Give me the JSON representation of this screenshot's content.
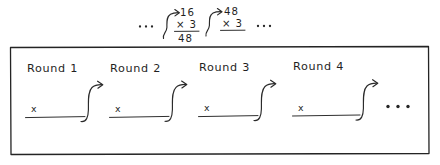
{
  "figure": {
    "title_present": false,
    "style": "hand-drawn sketch",
    "ink_color": "#2a2a2a",
    "background_color": "#ffffff"
  },
  "top_sequence": {
    "leading_ellipsis": "...",
    "trailing_ellipsis": "...",
    "steps": [
      {
        "operand": "16",
        "multiplier": "× 3",
        "result": "48",
        "has_result_rule": true,
        "connector": "s-curve-arrow"
      },
      {
        "operand": "48",
        "multiplier": "× 3",
        "result": "",
        "has_result_rule": true,
        "connector": "s-curve-arrow"
      }
    ]
  },
  "rounds_box": {
    "border_color": "#242424",
    "rounds": [
      {
        "label": "Round 1",
        "slot_value": "x",
        "connector": "s-curve-arrow"
      },
      {
        "label": "Round 2",
        "slot_value": "x",
        "connector": "s-curve-arrow"
      },
      {
        "label": "Round 3",
        "slot_value": "x",
        "connector": "s-curve-arrow"
      },
      {
        "label": "Round 4",
        "slot_value": "x",
        "connector": "s-curve-arrow"
      }
    ],
    "trailing_ellipsis": "..."
  }
}
